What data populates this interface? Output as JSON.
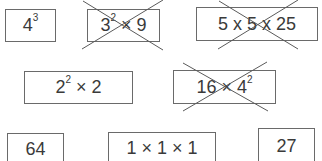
{
  "cards": [
    {
      "id": "c1",
      "base": "4",
      "exp": "3",
      "rest": "",
      "crossed": false,
      "box": [
        5,
        9,
        51,
        33
      ]
    },
    {
      "id": "c2",
      "base": "3",
      "exp": "2",
      "rest": " × 9",
      "crossed": true,
      "box": [
        87,
        9,
        73,
        33
      ]
    },
    {
      "id": "c3",
      "base": "5 x 5 x 25",
      "exp": "",
      "rest": "",
      "crossed": true,
      "box": [
        196,
        7,
        122,
        34
      ]
    },
    {
      "id": "c4",
      "base": "2",
      "exp": "2",
      "rest": " × 2",
      "crossed": false,
      "box": [
        24,
        71,
        109,
        33
      ]
    },
    {
      "id": "c5",
      "base": "16 × 4",
      "exp": "2",
      "rest": "",
      "crossed": true,
      "box": [
        173,
        70,
        103,
        34
      ]
    },
    {
      "id": "c6",
      "base": "64",
      "exp": "",
      "rest": "",
      "crossed": false,
      "box": [
        7,
        133,
        57,
        32
      ]
    },
    {
      "id": "c7",
      "base": "1 × 1 × 1",
      "exp": "",
      "rest": "",
      "crossed": false,
      "box": [
        108,
        132,
        108,
        33
      ]
    },
    {
      "id": "c8",
      "base": "27",
      "exp": "",
      "rest": "",
      "crossed": false,
      "box": [
        258,
        128,
        57,
        37
      ]
    }
  ],
  "crosses": [
    {
      "card": "c2",
      "lines": [
        [
          83,
          1,
          163,
          50
        ],
        [
          82,
          49,
          163,
          0
        ]
      ]
    },
    {
      "card": "c3",
      "lines": [
        [
          219,
          1,
          298,
          49
        ],
        [
          218,
          49,
          298,
          0
        ]
      ]
    },
    {
      "card": "c5",
      "lines": [
        [
          183,
          63,
          268,
          111
        ],
        [
          183,
          111,
          267,
          62
        ]
      ]
    }
  ],
  "colors": {
    "border": "#6a6a6a",
    "text": "#3a3a3a",
    "cross": "#5a5a5a"
  }
}
